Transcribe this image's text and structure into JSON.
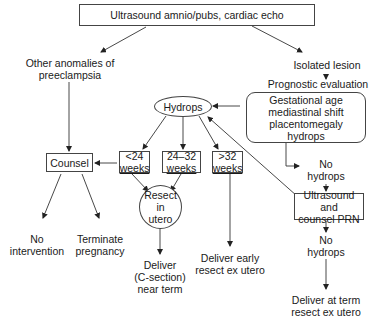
{
  "nodes": {
    "top": "Ultrasound amnio/pubs, cardiac echo",
    "other_anomalies": [
      "Other anomalies of",
      "preeclampsia"
    ],
    "isolated": "Isolated lesion",
    "prognostic": "Prognostic evaluation",
    "gestational": [
      "Gestational age",
      "mediastinal shift",
      "placentomegaly",
      "hydrops"
    ],
    "hydrops": "Hydrops",
    "counsel": "Counsel",
    "lt24": [
      "<24",
      "weeks"
    ],
    "w24_32": [
      "24–32",
      "weeks"
    ],
    "gt32": [
      ">32",
      "weeks"
    ],
    "no_hydrops_1": [
      "No",
      "hydrops"
    ],
    "resect": [
      "Resect",
      "in",
      "utero"
    ],
    "us_counsel": [
      "Ultrasound and",
      "counsel PRN"
    ],
    "no_intervention": [
      "No",
      "intervention"
    ],
    "terminate": [
      "Terminate",
      "pregnancy"
    ],
    "deliver_early": [
      "Deliver early",
      "resect ex utero"
    ],
    "no_hydrops_2": [
      "No",
      "hydrops"
    ],
    "deliver_csection": [
      "Deliver",
      "(C-section)",
      "near term"
    ],
    "deliver_term": [
      "Deliver at term",
      "resect ex utero"
    ]
  },
  "colors": {
    "line": "#333333",
    "text": "#1a1a1a",
    "background": "#ffffff"
  }
}
